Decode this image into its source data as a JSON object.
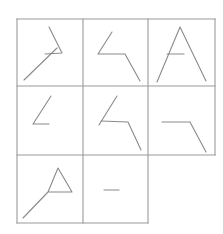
{
  "figure": {
    "width": 223,
    "height": 234,
    "background_color": "#ffffff",
    "grid_line_color": "#9a9a9a",
    "stroke_color": "#8a8a8a",
    "grid_line_width": 1.1,
    "stroke_width": 1.1
  },
  "grid": {
    "x_left": 17,
    "x_mid1": 83,
    "x_mid2": 148,
    "x_right": 215,
    "y_top": 19,
    "y_mid1": 86,
    "y_mid2": 155,
    "y_bottom": 223,
    "rows": 3,
    "cols": 3,
    "missing_cell": "row3-col3",
    "borders": [
      {
        "name": "outer-top",
        "x1": 17,
        "y1": 19,
        "x2": 215,
        "y2": 19
      },
      {
        "name": "row1-row2-divider",
        "x1": 17,
        "y1": 86,
        "x2": 215,
        "y2": 86
      },
      {
        "name": "row2-row3-divider",
        "x1": 17,
        "y1": 155,
        "x2": 215,
        "y2": 155
      },
      {
        "name": "outer-bottom",
        "x1": 17,
        "y1": 223,
        "x2": 148,
        "y2": 223
      },
      {
        "name": "outer-left",
        "x1": 17,
        "y1": 19,
        "x2": 17,
        "y2": 223
      },
      {
        "name": "col1-col2-divider",
        "x1": 83,
        "y1": 19,
        "x2": 83,
        "y2": 223
      },
      {
        "name": "col2-col3-divider",
        "x1": 148,
        "y1": 19,
        "x2": 148,
        "y2": 223
      },
      {
        "name": "outer-right",
        "x1": 215,
        "y1": 19,
        "x2": 215,
        "y2": 155
      }
    ]
  },
  "cells": [
    {
      "name": "cell-r1c1",
      "row": 1,
      "col": 1,
      "empty": false,
      "shapes": [
        {
          "name": "diagonal-slash",
          "type": "polyline",
          "points": [
            [
              24,
              80
            ],
            [
              57,
              48
            ]
          ]
        },
        {
          "name": "angle-chevron-right",
          "type": "polyline",
          "points": [
            [
              49,
              27
            ],
            [
              62,
              53
            ],
            [
              45,
              54
            ]
          ]
        }
      ]
    },
    {
      "name": "cell-r1c2",
      "row": 1,
      "col": 2,
      "empty": false,
      "shapes": [
        {
          "name": "zigzag-chevron-left",
          "type": "polyline",
          "points": [
            [
              112,
              32
            ],
            [
              98,
              54
            ],
            [
              125,
              54
            ],
            [
              140,
              81
            ]
          ]
        }
      ]
    },
    {
      "name": "cell-r1c3",
      "row": 1,
      "col": 3,
      "empty": false,
      "shapes": [
        {
          "name": "inverted-v-peak",
          "type": "polyline",
          "points": [
            [
              157,
              82
            ],
            [
              180,
              27
            ],
            [
              206,
              81
            ]
          ]
        },
        {
          "name": "crossbar-short",
          "type": "polyline",
          "points": [
            [
              167,
              54
            ],
            [
              184,
              54
            ]
          ]
        }
      ]
    },
    {
      "name": "cell-r2c1",
      "row": 2,
      "col": 1,
      "empty": false,
      "shapes": [
        {
          "name": "angle-less-than",
          "type": "polyline",
          "points": [
            [
              51,
              96
            ],
            [
              33,
              124
            ],
            [
              49,
              124
            ]
          ]
        }
      ]
    },
    {
      "name": "cell-r2c2",
      "row": 2,
      "col": 2,
      "empty": false,
      "shapes": [
        {
          "name": "diagonal-slash",
          "type": "polyline",
          "points": [
            [
              99,
              125
            ],
            [
              117,
              96
            ]
          ]
        },
        {
          "name": "angle-flag-down-right",
          "type": "polyline",
          "points": [
            [
              101,
              121
            ],
            [
              128,
              122
            ],
            [
              141,
              150
            ]
          ]
        }
      ]
    },
    {
      "name": "cell-r2c3",
      "row": 2,
      "col": 3,
      "empty": false,
      "shapes": [
        {
          "name": "horizontal-then-diagonal",
          "type": "polyline",
          "points": [
            [
              162,
              122
            ],
            [
              190,
              122
            ],
            [
              206,
              152
            ]
          ]
        }
      ]
    },
    {
      "name": "cell-r3c1",
      "row": 3,
      "col": 1,
      "empty": false,
      "shapes": [
        {
          "name": "triangle-with-extended-leg",
          "type": "polyline",
          "points": [
            [
              23,
              218
            ],
            [
              48,
              192
            ],
            [
              58,
              168
            ],
            [
              72,
              192
            ],
            [
              48,
              192
            ]
          ]
        }
      ]
    },
    {
      "name": "cell-r3c2",
      "row": 3,
      "col": 2,
      "empty": false,
      "shapes": [
        {
          "name": "horizontal-dash",
          "type": "polyline",
          "points": [
            [
              104,
              190
            ],
            [
              119,
              190
            ]
          ]
        }
      ]
    },
    {
      "name": "cell-r3c3",
      "row": 3,
      "col": 3,
      "empty": true,
      "shapes": []
    }
  ]
}
